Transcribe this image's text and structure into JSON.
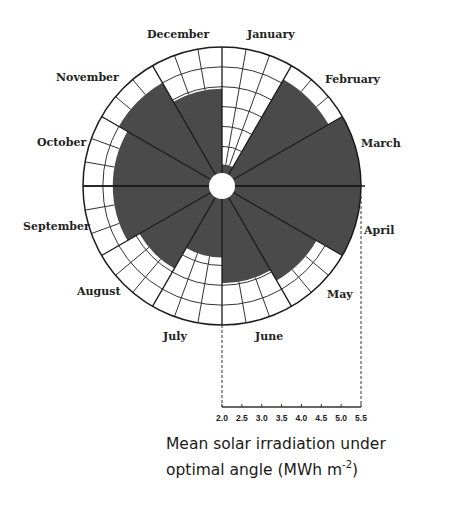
{
  "chart_data": {
    "type": "polar-bar",
    "title": "",
    "categories": [
      "January",
      "February",
      "March",
      "April",
      "May",
      "June",
      "July",
      "August",
      "September",
      "October",
      "November",
      "December"
    ],
    "values": [
      2.55,
      5.1,
      5.5,
      5.5,
      4.75,
      4.45,
      3.8,
      4.4,
      4.75,
      4.75,
      5.0,
      4.45
    ],
    "radial_axis": {
      "label_line1": "Mean solar irradiation under",
      "label_line2_prefix": "optimal angle (MWh m",
      "label_line2_sup": "-2",
      "label_line2_suffix": ")",
      "range": [
        2.0,
        5.5
      ],
      "ticks": [
        "2.0",
        "2.5",
        "3.0",
        "3.5",
        "4.0",
        "4.5",
        "5.0",
        "5.5"
      ]
    },
    "orientation": "clockwise from top, January first",
    "fill_color": "#4a4a4a",
    "grid_color": "#333333"
  },
  "labels": {
    "january": "January",
    "february": "February",
    "march": "March",
    "april": "April",
    "may": "May",
    "june": "June",
    "july": "July",
    "august": "August",
    "september": "September",
    "october": "October",
    "november": "November",
    "december": "December"
  }
}
